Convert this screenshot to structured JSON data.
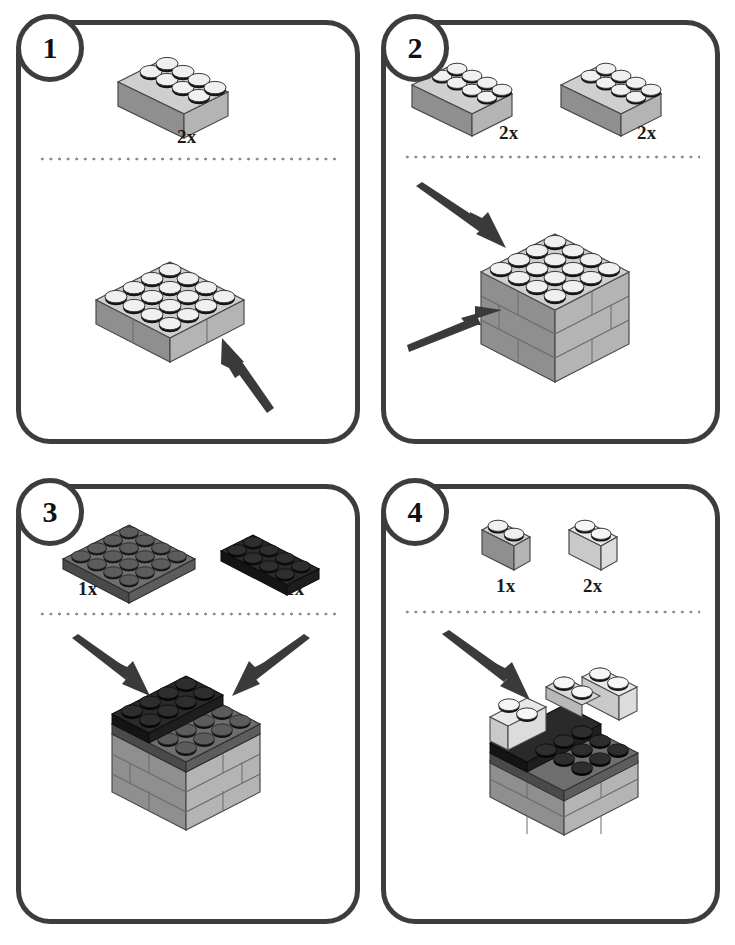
{
  "document": {
    "title": "LEGO Brick Building Instructions",
    "type": "assembly-instruction-sheet",
    "panel_count": 4,
    "stroke_color": "#3d3d3d",
    "background_color": "#ffffff"
  },
  "palette": {
    "brick_light_top": "#e8e8e8",
    "brick_light_left": "#c9c9c9",
    "brick_light_right": "#dcdcdc",
    "brick_medium_top": "#cfcfcf",
    "brick_medium_left": "#8f8f8f",
    "brick_medium_right": "#b4b4b4",
    "brick_dark_top": "#6e6e6e",
    "brick_dark_left": "#4a4a4a",
    "brick_dark_right": "#5d5d5d",
    "brick_black_top": "#2a2a2a",
    "brick_black_left": "#141414",
    "brick_black_right": "#1e1e1e",
    "stud_highlight": "#f2f2f2",
    "stud_shadow": "#111111",
    "outline": "#3d3d3d",
    "arrow": "#3a3a3a",
    "divider_dot": "#8d8d8d"
  },
  "panels": [
    {
      "id": "panel-1",
      "step_number": "1",
      "parts": [
        {
          "label": "2x",
          "part": "brick-2x4",
          "color": "medium-gray",
          "studs": 8
        }
      ],
      "assembly": {
        "description": "Two 2x4 medium gray bricks joined side by side forming a 4x4 base layer",
        "layers": 1,
        "top_studs": "4x4",
        "arrow_count": 1
      }
    },
    {
      "id": "panel-2",
      "step_number": "2",
      "parts": [
        {
          "label": "2x",
          "part": "brick-2x4",
          "color": "medium-gray",
          "studs": 8
        },
        {
          "label": "2x",
          "part": "brick-2x4",
          "color": "medium-gray",
          "studs": 8
        }
      ],
      "assembly": {
        "description": "Three stacked layers of 2x4 bricks forming a 4x4x3 cube",
        "layers": 3,
        "top_studs": "4x4",
        "arrow_count": 2
      }
    },
    {
      "id": "panel-3",
      "step_number": "3",
      "parts": [
        {
          "label": "1x",
          "part": "plate-4x4",
          "color": "dark-gray",
          "studs": 16
        },
        {
          "label": "1x",
          "part": "plate-2x4",
          "color": "black",
          "studs": 8
        }
      ],
      "assembly": {
        "description": "Dark gray 4x4 plate on the cube with a black 2x4 plate on the back half",
        "layers": 3,
        "top_studs": "4x4",
        "arrow_count": 2
      }
    },
    {
      "id": "panel-4",
      "step_number": "4",
      "parts": [
        {
          "label": "1x",
          "part": "brick-1x2",
          "color": "medium-gray",
          "studs": 2
        },
        {
          "label": "2x",
          "part": "brick-1x2",
          "color": "light-gray",
          "studs": 2
        }
      ],
      "assembly": {
        "description": "Three 1x2 bricks placed along the back edges leaving a front opening",
        "layers": 4,
        "top_studs": "partial",
        "arrow_count": 1
      }
    }
  ]
}
